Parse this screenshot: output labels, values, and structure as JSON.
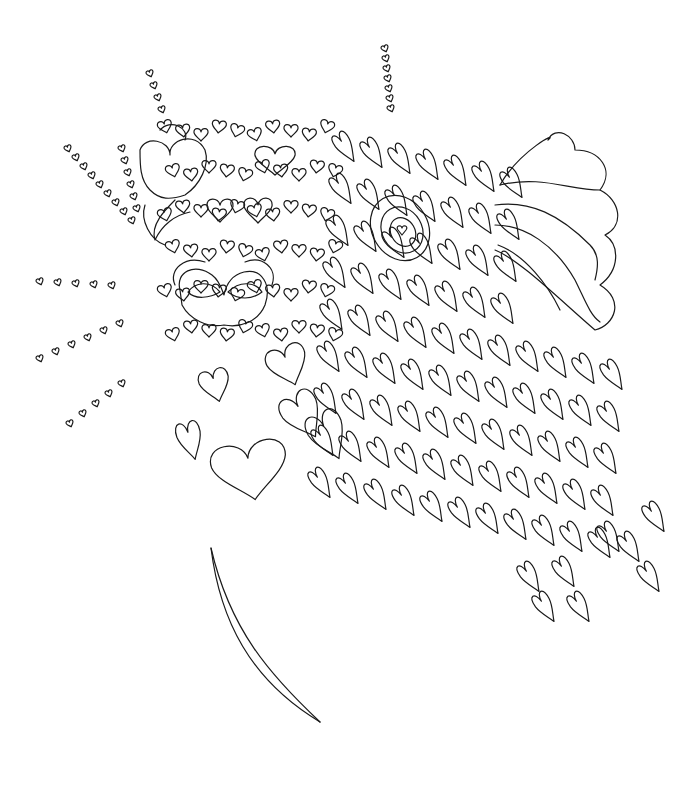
{
  "artwork": {
    "title": "Heart dog coloring page",
    "background": "#ffffff",
    "stroke_color": "#1a1a1a",
    "subject": "dog face composed of hearts with floppy ear and nose, plus a stem curve"
  },
  "dot_trails": [
    {
      "x0": 150,
      "y0": 70,
      "dx": 4,
      "dy": 12,
      "n": 4,
      "s": 4
    },
    {
      "x0": 385,
      "y0": 45,
      "dx": 1,
      "dy": 10,
      "n": 7,
      "s": 4
    },
    {
      "x0": 68,
      "y0": 145,
      "dx": 8,
      "dy": 9,
      "n": 9,
      "s": 4
    },
    {
      "x0": 122,
      "y0": 145,
      "dx": 3,
      "dy": 12,
      "n": 6,
      "s": 4
    },
    {
      "x0": 40,
      "y0": 278,
      "dx": 18,
      "dy": 1,
      "n": 5,
      "s": 4
    },
    {
      "x0": 40,
      "y0": 355,
      "dx": 16,
      "dy": -7,
      "n": 6,
      "s": 4
    },
    {
      "x0": 70,
      "y0": 420,
      "dx": 13,
      "dy": -10,
      "n": 5,
      "s": 4
    }
  ],
  "big_hearts": [
    {
      "x": 250,
      "y": 470,
      "w": 75,
      "h": 60,
      "r": -10
    },
    {
      "x": 303,
      "y": 415,
      "w": 38,
      "h": 50,
      "r": -30
    },
    {
      "x": 328,
      "y": 435,
      "w": 36,
      "h": 52,
      "r": -25
    },
    {
      "x": 288,
      "y": 365,
      "w": 40,
      "h": 42,
      "r": -20
    },
    {
      "x": 190,
      "y": 440,
      "w": 24,
      "h": 40,
      "r": -15
    },
    {
      "x": 215,
      "y": 385,
      "w": 30,
      "h": 34,
      "r": -15
    },
    {
      "x": 275,
      "y": 160,
      "w": 40,
      "h": 30,
      "r": 0
    },
    {
      "x": 220,
      "y": 210,
      "w": 26,
      "h": 24,
      "r": 0
    },
    {
      "x": 258,
      "y": 210,
      "w": 28,
      "h": 26,
      "r": 0
    }
  ],
  "fringe_hearts_rows": 9,
  "fringe_hearts_cols": 11
}
